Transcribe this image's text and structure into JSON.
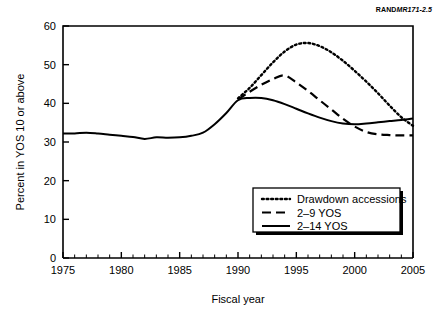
{
  "figure": {
    "id_prefix": "RAND",
    "id_number": "MR171-2.5",
    "background": "#ffffff",
    "line_color": "#000000"
  },
  "chart_data": {
    "type": "line",
    "title": "",
    "xlabel": "Fiscal year",
    "ylabel": "Percent in YOS 10 or above",
    "xlim": [
      1975,
      2005
    ],
    "ylim": [
      0,
      60
    ],
    "xticks": [
      1975,
      1980,
      1985,
      1990,
      1995,
      2000,
      2005
    ],
    "yticks": [
      0,
      10,
      20,
      30,
      40,
      50,
      60
    ],
    "xtick_labels": [
      "1975",
      "1980",
      "1985",
      "1990",
      "1995",
      "2000",
      "2005"
    ],
    "ytick_labels": [
      "0",
      "10",
      "20",
      "30",
      "40",
      "50",
      "60"
    ],
    "x_minor_tick_interval": 1,
    "grid": false,
    "legend_position": "lower right",
    "series": [
      {
        "name": "Drawdown accessions",
        "style": "dotted",
        "x": [
          1990,
          1991,
          1992,
          1993,
          1994,
          1995,
          1996,
          1997,
          1998,
          1999,
          2000,
          2001,
          2002,
          2003,
          2004,
          2005
        ],
        "values": [
          41.3,
          44.0,
          47.3,
          50.6,
          53.4,
          55.2,
          55.6,
          54.8,
          53.2,
          51.0,
          48.4,
          45.6,
          42.6,
          39.4,
          36.4,
          34.2
        ]
      },
      {
        "name": "2–9 YOS",
        "style": "dashed",
        "x": [
          1990,
          1991,
          1992,
          1993,
          1994,
          1995,
          1996,
          1997,
          1998,
          1999,
          2000,
          2001,
          2002,
          2003,
          2004,
          2005
        ],
        "values": [
          41.0,
          43.0,
          44.8,
          46.3,
          47.2,
          45.4,
          43.2,
          40.8,
          38.4,
          36.0,
          34.0,
          32.6,
          32.0,
          31.8,
          31.7,
          31.7
        ]
      },
      {
        "name": "2–14 YOS",
        "style": "solid",
        "x": [
          1975,
          1976,
          1977,
          1978,
          1979,
          1980,
          1981,
          1982,
          1983,
          1984,
          1985,
          1986,
          1987,
          1988,
          1989,
          1990,
          1991,
          1992,
          1993,
          1994,
          1995,
          1996,
          1997,
          1998,
          1999,
          2000,
          2001,
          2002,
          2003,
          2004,
          2005
        ],
        "values": [
          32.2,
          32.2,
          32.4,
          32.2,
          31.9,
          31.6,
          31.3,
          30.8,
          31.2,
          31.1,
          31.2,
          31.6,
          32.4,
          34.6,
          37.5,
          40.8,
          41.4,
          41.4,
          40.8,
          39.8,
          38.6,
          37.4,
          36.3,
          35.4,
          34.8,
          34.6,
          34.8,
          35.1,
          35.4,
          35.7,
          36.1
        ]
      }
    ]
  },
  "legend": {
    "items": [
      {
        "label": "Drawdown accessions",
        "style": "dotted"
      },
      {
        "label": "2–9 YOS",
        "style": "dashed"
      },
      {
        "label": "2–14 YOS",
        "style": "solid"
      }
    ]
  }
}
